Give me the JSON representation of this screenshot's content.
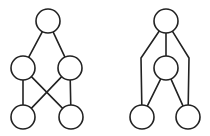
{
  "canvas": {
    "width": 210,
    "height": 136,
    "background": "#ffffff",
    "stroke": "#222222"
  },
  "diagrams": [
    {
      "name": "left-graph",
      "node_radius": 12,
      "nodes": [
        {
          "id": "A",
          "x": 48,
          "y": 21
        },
        {
          "id": "B",
          "x": 23,
          "y": 68
        },
        {
          "id": "C",
          "x": 70,
          "y": 68
        },
        {
          "id": "D",
          "x": 23,
          "y": 117
        },
        {
          "id": "E",
          "x": 71,
          "y": 117
        }
      ],
      "edges": [
        {
          "from": "A",
          "to": "B"
        },
        {
          "from": "A",
          "to": "C"
        },
        {
          "from": "B",
          "to": "D"
        },
        {
          "from": "C",
          "to": "E"
        },
        {
          "from": "B",
          "to": "E"
        },
        {
          "from": "C",
          "to": "D"
        }
      ]
    },
    {
      "name": "right-graph",
      "node_radius": 12,
      "nodes": [
        {
          "id": "A",
          "x": 166,
          "y": 21
        },
        {
          "id": "B",
          "x": 166,
          "y": 68
        },
        {
          "id": "C",
          "x": 142,
          "y": 117
        },
        {
          "id": "D",
          "x": 188,
          "y": 117
        }
      ],
      "edges": [
        {
          "from": "A",
          "to": "B"
        },
        {
          "from": "B",
          "to": "C"
        },
        {
          "from": "B",
          "to": "D"
        },
        {
          "from": "A",
          "to": "C",
          "via": [
            [
              141,
              58
            ]
          ]
        },
        {
          "from": "A",
          "to": "D",
          "via": [
            [
              189,
              58
            ]
          ]
        }
      ]
    }
  ]
}
